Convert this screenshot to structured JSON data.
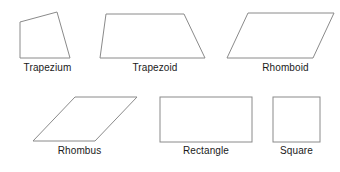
{
  "diagram": {
    "background_color": "#ffffff",
    "stroke_color": "#8a8a8a",
    "label_color": "#1a1a1a",
    "canvas": {
      "width": 340,
      "height": 172
    },
    "rows": [
      {
        "name": "top-row",
        "shape_keys": [
          "trapezium",
          "trapezoid",
          "rhomboid"
        ]
      },
      {
        "name": "bottom-row",
        "shape_keys": [
          "rhombus",
          "rectangle",
          "square"
        ]
      }
    ],
    "shapes": [
      {
        "key": "trapezium",
        "label": "Trapezium",
        "type": "polygon",
        "points": "20,22 57,12 70,58 20,58",
        "label_left": 5,
        "label_top": 62,
        "label_width": 85
      },
      {
        "key": "trapezoid",
        "label": "Trapezoid",
        "type": "polygon",
        "points": "106,14 184,14 205,58 100,58",
        "label_left": 110,
        "label_top": 62,
        "label_width": 90
      },
      {
        "key": "rhomboid",
        "label": "Rhomboid",
        "type": "polygon",
        "points": "248,13 334,13 313,58 227,58",
        "label_left": 243,
        "label_top": 62,
        "label_width": 85
      },
      {
        "key": "rhombus",
        "label": "Rhombus",
        "type": "polygon",
        "points": "75,97 137,97 95,141 33,141",
        "label_left": 37,
        "label_top": 145,
        "label_width": 85
      },
      {
        "key": "rectangle",
        "label": "Rectangle",
        "type": "rect",
        "x": 160,
        "y": 97,
        "width": 92,
        "height": 45,
        "label_left": 160,
        "label_top": 145,
        "label_width": 92
      },
      {
        "key": "square",
        "label": "Square",
        "type": "rect",
        "x": 273,
        "y": 97,
        "width": 47,
        "height": 45,
        "label_left": 268,
        "label_top": 145,
        "label_width": 57
      }
    ]
  }
}
